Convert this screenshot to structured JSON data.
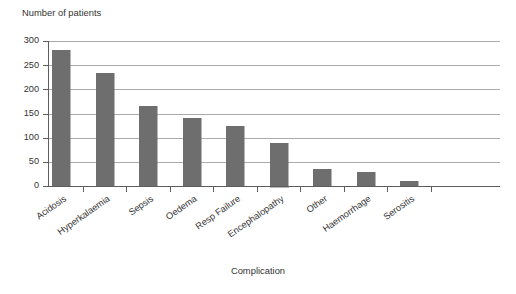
{
  "chart_data": {
    "type": "bar",
    "title": "",
    "subtitle": "",
    "xlabel": "Complication",
    "ylabel": "Number of patients",
    "categories": [
      "Acidosis",
      "Hyperkalaemia",
      "Sepsis",
      "Oedema",
      "Resp Failure",
      "Encephalopathy",
      "Other",
      "Haemorrhage",
      "Serositis"
    ],
    "values": [
      281,
      233,
      166,
      140,
      124,
      90,
      35,
      29,
      10
    ],
    "ylim": [
      0,
      300
    ],
    "yticks": [
      0,
      50,
      100,
      150,
      200,
      250,
      300
    ],
    "ytick_labels": [
      "0",
      "50",
      "100",
      "150",
      "200",
      "250",
      "300"
    ],
    "grid": true,
    "grid_axis": "y",
    "legend": false,
    "legend_position": "none",
    "bar_color": "#6e6e6e",
    "bar_edge_color": "#6e6e6e",
    "gridline_color": "#9c9c9c",
    "axis_color": "#5d5d5d",
    "background_color": "#ffffff",
    "xtick_label_rotation": -35
  },
  "geometry": {
    "plot_left": 48,
    "plot_right": 500,
    "plot_top": 41,
    "plot_bottom": 186,
    "bar_width": 18,
    "category_step": 43.5,
    "first_bar_center": 61,
    "ylabel_x": 22,
    "ylabel_y": 16,
    "xlabel_x": 258,
    "xlabel_y": 274
  }
}
